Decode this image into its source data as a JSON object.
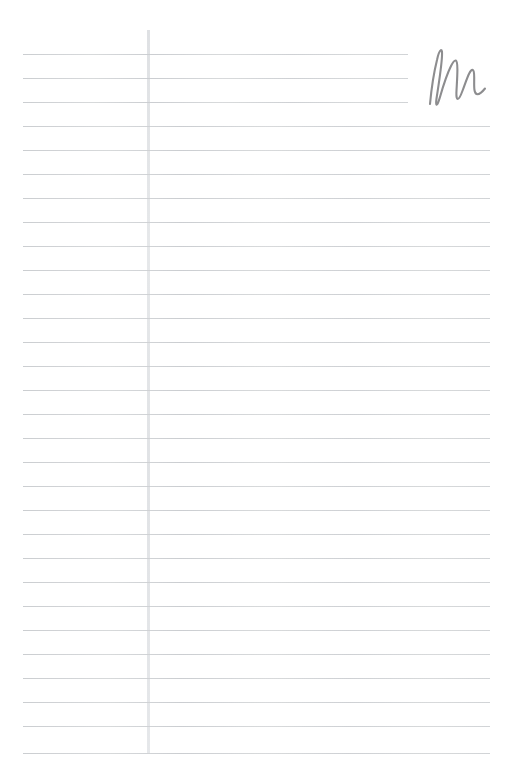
{
  "page": {
    "kind": "ruled-notepaper",
    "width": 509,
    "height": 776,
    "background_color": "#ffffff",
    "is_blank": true,
    "visible_text": ""
  },
  "paper": {
    "rule_color": "#d6d8da",
    "margin_rule_color": "#e3e5e7",
    "rule_count": 30,
    "first_rule_y": 54,
    "rule_spacing": 23.8,
    "rule_left_x": 23,
    "rule_right_x": 490,
    "short_rule_right_x": 408,
    "short_rule_count": 3,
    "margin_rule_x": 147,
    "margin_rule_top_y": 30,
    "margin_rule_bottom_y": 753,
    "margin_rule_width": 3,
    "rules": [
      {
        "index": 1,
        "y": 54,
        "x_start": 23,
        "x_end": 408
      },
      {
        "index": 2,
        "y": 78,
        "x_start": 23,
        "x_end": 408
      },
      {
        "index": 3,
        "y": 102,
        "x_start": 23,
        "x_end": 408
      },
      {
        "index": 4,
        "y": 126,
        "x_start": 23,
        "x_end": 490
      },
      {
        "index": 5,
        "y": 150,
        "x_start": 23,
        "x_end": 490
      },
      {
        "index": 6,
        "y": 174,
        "x_start": 23,
        "x_end": 490
      },
      {
        "index": 7,
        "y": 198,
        "x_start": 23,
        "x_end": 490
      },
      {
        "index": 8,
        "y": 222,
        "x_start": 23,
        "x_end": 490
      },
      {
        "index": 9,
        "y": 246,
        "x_start": 23,
        "x_end": 490
      },
      {
        "index": 10,
        "y": 270,
        "x_start": 23,
        "x_end": 490
      },
      {
        "index": 11,
        "y": 294,
        "x_start": 23,
        "x_end": 490
      },
      {
        "index": 12,
        "y": 318,
        "x_start": 23,
        "x_end": 490
      },
      {
        "index": 13,
        "y": 342,
        "x_start": 23,
        "x_end": 490
      },
      {
        "index": 14,
        "y": 366,
        "x_start": 23,
        "x_end": 490
      },
      {
        "index": 15,
        "y": 390,
        "x_start": 23,
        "x_end": 490
      },
      {
        "index": 16,
        "y": 414,
        "x_start": 23,
        "x_end": 490
      },
      {
        "index": 17,
        "y": 438,
        "x_start": 23,
        "x_end": 490
      },
      {
        "index": 18,
        "y": 462,
        "x_start": 23,
        "x_end": 490
      },
      {
        "index": 19,
        "y": 486,
        "x_start": 23,
        "x_end": 490
      },
      {
        "index": 20,
        "y": 510,
        "x_start": 23,
        "x_end": 490
      },
      {
        "index": 21,
        "y": 534,
        "x_start": 23,
        "x_end": 490
      },
      {
        "index": 22,
        "y": 558,
        "x_start": 23,
        "x_end": 490
      },
      {
        "index": 23,
        "y": 582,
        "x_start": 23,
        "x_end": 490
      },
      {
        "index": 24,
        "y": 606,
        "x_start": 23,
        "x_end": 490
      },
      {
        "index": 25,
        "y": 630,
        "x_start": 23,
        "x_end": 490
      },
      {
        "index": 26,
        "y": 654,
        "x_start": 23,
        "x_end": 490
      },
      {
        "index": 27,
        "y": 678,
        "x_start": 23,
        "x_end": 490
      },
      {
        "index": 28,
        "y": 702,
        "x_start": 23,
        "x_end": 490
      },
      {
        "index": 29,
        "y": 726,
        "x_start": 23,
        "x_end": 490
      },
      {
        "index": 30,
        "y": 753,
        "x_start": 23,
        "x_end": 490
      }
    ]
  },
  "annotation": {
    "label": "M",
    "description": "handwritten cursive letter M",
    "ink_color": "#8d8d8f",
    "stroke_width": 2.1,
    "x": 424,
    "y": 46,
    "width": 66,
    "height": 62,
    "path": "M 6 58 C 7.5 42 10 26 13 14 C 14 9 15.5 5 17 4 C 18 4 18.2 6 18 10 C 17.4 22 14.4 40 12.6 52 C 12 56 11.8 58 12.4 58.5 C 13.2 59 14.4 56.5 16 51 C 19 40.5 23.5 27 27 20 C 29 16 30.6 14 31.8 14.5 C 33 15 33.4 18 33.4 23.5 C 33.4 31.5 32.6 41 32.4 47 C 32.3 51 32.8 53 33.8 53 C 35 53 36.6 50 38.6 44.5 C 41 38 43.4 31 45.2 27.5 C 46.6 24.8 47.8 23.5 48.8 24 C 49.8 24.5 50.2 27 50.2 31.5 C 50.2 36.5 50 40.5 50.4 43.5 C 50.8 46.6 51.8 48.2 53.6 48.2 C 55.6 48.2 58.2 46 61 42.5"
  }
}
